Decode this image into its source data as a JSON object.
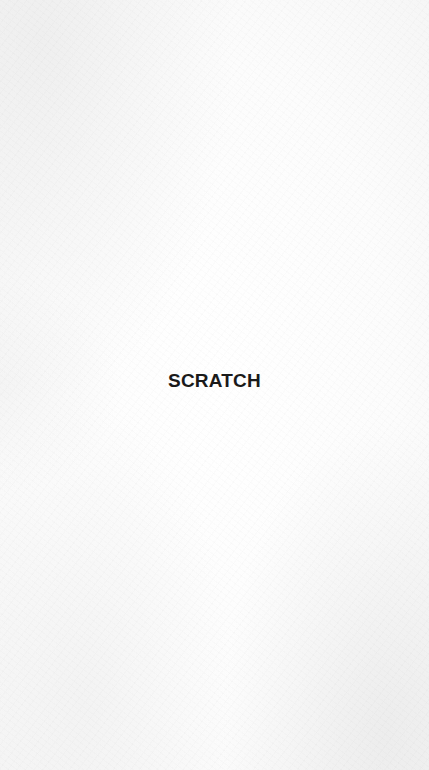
{
  "screen": {
    "background_color": "#fbfbfb",
    "label": "SCRATCH",
    "label_color": "#1a1a1a"
  }
}
